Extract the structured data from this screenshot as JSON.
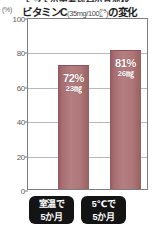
{
  "chart_data": {
    "type": "bar",
    "title": "ビタミンC(35mg/100㌘)の変化",
    "title_main": "ビタミンC",
    "title_paren": "(35mg/100㌘)",
    "title_tail": "の変化",
    "clipped_top_line": "トマトの栄養成分の月変化",
    "ylabel": "(%)",
    "xlabel": "",
    "ylim": [
      0,
      100
    ],
    "yticks": [
      0,
      20,
      40,
      60,
      80,
      100
    ],
    "ytick_labels": [
      "0",
      "20",
      "40",
      "60",
      "80",
      "100"
    ],
    "grid": true,
    "legend": "none",
    "categories": [
      "室温で 5か月",
      "5℃で 5か月"
    ],
    "category_lines": [
      [
        "室温で",
        "5か月"
      ],
      [
        "5℃で",
        "5か月"
      ]
    ],
    "values": [
      72,
      81
    ],
    "value_labels": [
      "72%",
      "81%"
    ],
    "secondary_labels": [
      "23㎎",
      "26㎎"
    ],
    "secondary_values": [
      23,
      26
    ],
    "secondary_unit": "㎎",
    "series": [
      {
        "name": "ビタミンC残存率",
        "values": [
          72,
          81
        ],
        "amounts": [
          23,
          26
        ]
      }
    ],
    "colors": {
      "bar_fill": "#b47f81",
      "bar_edge": "#93595c",
      "plot_border": "#7d7d7d",
      "gridline": "#b9b9b9",
      "pill_bg": "#141414",
      "pill_text": "#ffffff",
      "tick_text": "#5d5d5d",
      "title_text": "#1c1c1c",
      "background": "#ffffff"
    }
  }
}
